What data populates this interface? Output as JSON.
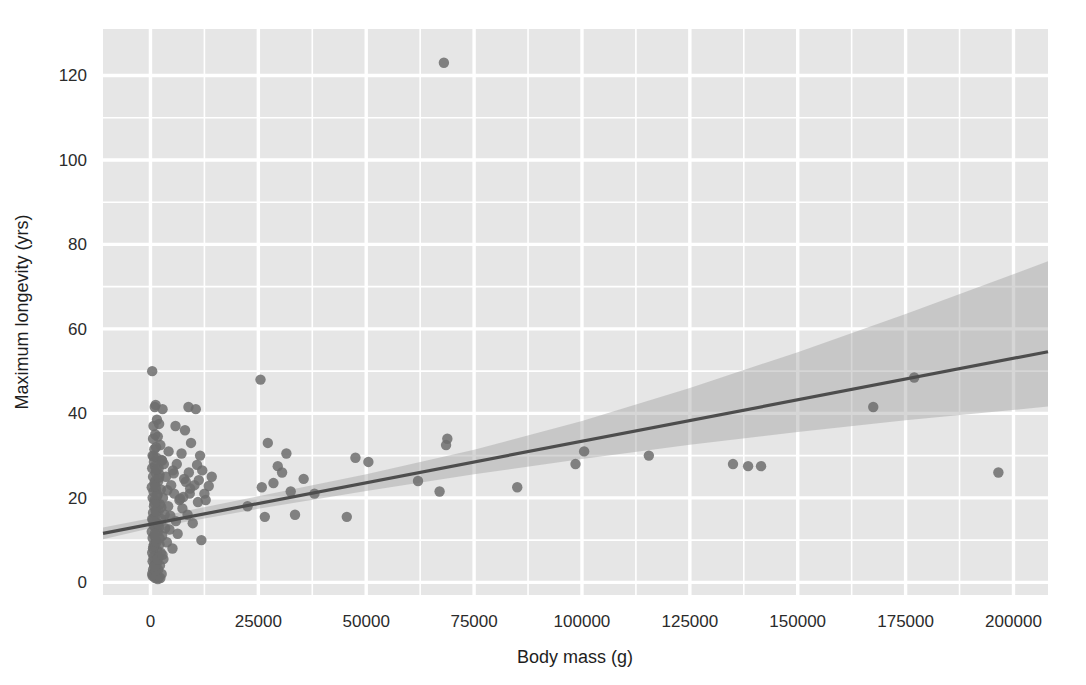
{
  "chart_data": {
    "type": "scatter",
    "title": "",
    "xlabel": "Body mass (g)",
    "ylabel": "Maximum longevity (yrs)",
    "xlim": [
      -11000,
      208000
    ],
    "ylim": [
      -3,
      131
    ],
    "xticks": [
      0,
      25000,
      50000,
      75000,
      100000,
      125000,
      150000,
      175000,
      200000
    ],
    "xticklabels": [
      "0",
      "25000",
      "50000",
      "75000",
      "100000",
      "125000",
      "150000",
      "175000",
      "200000"
    ],
    "yticks": [
      0,
      20,
      40,
      60,
      80,
      100,
      120
    ],
    "yticklabels": [
      "0",
      "20",
      "40",
      "60",
      "80",
      "100",
      "120"
    ],
    "grid": true,
    "grid_color": "#ffffff",
    "plot_background": "#e6e6e6",
    "figure_background": "#ffffff",
    "legend": null,
    "point_color": "#6d6d6d",
    "point_radius": 5.2,
    "point_opacity": 0.85,
    "regression": {
      "label": "linear fit",
      "line_color": "#4d4d4d",
      "line_width": 3.2,
      "intercept": 13.8,
      "slope_per_unit": 0.000196,
      "x_start": -11000,
      "x_end": 208000,
      "y_start": 11.6,
      "y_end": 54.6
    },
    "confidence_band": {
      "label": "95% CI",
      "fill_color": "#9e9e9e",
      "fill_opacity": 0.42,
      "x": [
        -11000,
        0,
        25000,
        50000,
        75000,
        100000,
        125000,
        150000,
        175000,
        208000
      ],
      "upper": [
        13.0,
        15.2,
        20.4,
        25.6,
        31.4,
        38.2,
        46.0,
        54.5,
        63.5,
        76.0
      ],
      "lower": [
        10.2,
        12.8,
        17.4,
        21.6,
        25.6,
        29.2,
        32.6,
        35.6,
        38.4,
        41.6
      ]
    },
    "points": [
      {
        "x": 400,
        "y": 50.0
      },
      {
        "x": 1200,
        "y": 42.0
      },
      {
        "x": 1000,
        "y": 41.5
      },
      {
        "x": 2800,
        "y": 41.0
      },
      {
        "x": 8800,
        "y": 41.5
      },
      {
        "x": 10500,
        "y": 41.0
      },
      {
        "x": 1500,
        "y": 38.5
      },
      {
        "x": 2000,
        "y": 37.5
      },
      {
        "x": 700,
        "y": 37.0
      },
      {
        "x": 5800,
        "y": 37.0
      },
      {
        "x": 8000,
        "y": 36.0
      },
      {
        "x": 1100,
        "y": 35.0
      },
      {
        "x": 1700,
        "y": 34.5
      },
      {
        "x": 600,
        "y": 34.0
      },
      {
        "x": 9400,
        "y": 33.0
      },
      {
        "x": 2300,
        "y": 32.5
      },
      {
        "x": 1300,
        "y": 32.0
      },
      {
        "x": 900,
        "y": 31.5
      },
      {
        "x": 4200,
        "y": 31.0
      },
      {
        "x": 7200,
        "y": 30.5
      },
      {
        "x": 11500,
        "y": 30.0
      },
      {
        "x": 500,
        "y": 30.0
      },
      {
        "x": 1400,
        "y": 29.5
      },
      {
        "x": 2600,
        "y": 29.0
      },
      {
        "x": 800,
        "y": 28.5
      },
      {
        "x": 3100,
        "y": 28.0
      },
      {
        "x": 6100,
        "y": 28.0
      },
      {
        "x": 1000,
        "y": 27.5
      },
      {
        "x": 1900,
        "y": 27.0
      },
      {
        "x": 400,
        "y": 27.0
      },
      {
        "x": 5200,
        "y": 26.5
      },
      {
        "x": 8900,
        "y": 26.0
      },
      {
        "x": 1200,
        "y": 26.0
      },
      {
        "x": 2100,
        "y": 25.5
      },
      {
        "x": 600,
        "y": 25.0
      },
      {
        "x": 3600,
        "y": 25.0
      },
      {
        "x": 7800,
        "y": 24.5
      },
      {
        "x": 1100,
        "y": 24.0
      },
      {
        "x": 1800,
        "y": 24.0
      },
      {
        "x": 900,
        "y": 23.5
      },
      {
        "x": 4800,
        "y": 23.0
      },
      {
        "x": 10200,
        "y": 23.0
      },
      {
        "x": 300,
        "y": 22.5
      },
      {
        "x": 2400,
        "y": 22.0
      },
      {
        "x": 1300,
        "y": 22.0
      },
      {
        "x": 700,
        "y": 21.5
      },
      {
        "x": 5500,
        "y": 21.0
      },
      {
        "x": 9100,
        "y": 21.0
      },
      {
        "x": 1600,
        "y": 20.5
      },
      {
        "x": 2900,
        "y": 20.0
      },
      {
        "x": 500,
        "y": 20.0
      },
      {
        "x": 1000,
        "y": 19.5
      },
      {
        "x": 6700,
        "y": 19.5
      },
      {
        "x": 11000,
        "y": 19.0
      },
      {
        "x": 1400,
        "y": 19.0
      },
      {
        "x": 2200,
        "y": 18.5
      },
      {
        "x": 800,
        "y": 18.0
      },
      {
        "x": 4100,
        "y": 18.0
      },
      {
        "x": 7400,
        "y": 17.5
      },
      {
        "x": 1200,
        "y": 17.0
      },
      {
        "x": 1900,
        "y": 17.0
      },
      {
        "x": 600,
        "y": 16.5
      },
      {
        "x": 3300,
        "y": 16.0
      },
      {
        "x": 8600,
        "y": 16.0
      },
      {
        "x": 1000,
        "y": 15.5
      },
      {
        "x": 2500,
        "y": 15.0
      },
      {
        "x": 400,
        "y": 15.0
      },
      {
        "x": 5900,
        "y": 14.5
      },
      {
        "x": 1500,
        "y": 14.0
      },
      {
        "x": 9800,
        "y": 14.0
      },
      {
        "x": 700,
        "y": 13.5
      },
      {
        "x": 2000,
        "y": 13.0
      },
      {
        "x": 1100,
        "y": 13.0
      },
      {
        "x": 4400,
        "y": 12.5
      },
      {
        "x": 300,
        "y": 12.0
      },
      {
        "x": 1700,
        "y": 12.0
      },
      {
        "x": 6300,
        "y": 11.5
      },
      {
        "x": 900,
        "y": 11.0
      },
      {
        "x": 2700,
        "y": 11.0
      },
      {
        "x": 11800,
        "y": 10.0
      },
      {
        "x": 500,
        "y": 10.5
      },
      {
        "x": 1300,
        "y": 10.0
      },
      {
        "x": 3800,
        "y": 9.5
      },
      {
        "x": 800,
        "y": 9.0
      },
      {
        "x": 2100,
        "y": 9.0
      },
      {
        "x": 1000,
        "y": 8.5
      },
      {
        "x": 5100,
        "y": 8.0
      },
      {
        "x": 600,
        "y": 8.0
      },
      {
        "x": 1600,
        "y": 7.5
      },
      {
        "x": 400,
        "y": 7.0
      },
      {
        "x": 2400,
        "y": 7.0
      },
      {
        "x": 1200,
        "y": 6.5
      },
      {
        "x": 700,
        "y": 6.0
      },
      {
        "x": 1900,
        "y": 6.0
      },
      {
        "x": 3000,
        "y": 5.5
      },
      {
        "x": 1000,
        "y": 5.0
      },
      {
        "x": 500,
        "y": 5.0
      },
      {
        "x": 1500,
        "y": 4.5
      },
      {
        "x": 900,
        "y": 4.0
      },
      {
        "x": 2200,
        "y": 4.0
      },
      {
        "x": 1300,
        "y": 3.5
      },
      {
        "x": 600,
        "y": 3.0
      },
      {
        "x": 1800,
        "y": 3.0
      },
      {
        "x": 1000,
        "y": 2.5
      },
      {
        "x": 400,
        "y": 2.0
      },
      {
        "x": 2600,
        "y": 2.0
      },
      {
        "x": 1400,
        "y": 1.8
      },
      {
        "x": 800,
        "y": 1.5
      },
      {
        "x": 2000,
        "y": 1.2
      },
      {
        "x": 1100,
        "y": 1.0
      },
      {
        "x": 1700,
        "y": 0.8
      },
      {
        "x": 500,
        "y": 1.5
      },
      {
        "x": 2300,
        "y": 1.0
      },
      {
        "x": 1200,
        "y": 2.8
      },
      {
        "x": 900,
        "y": 3.8
      },
      {
        "x": 1600,
        "y": 5.5
      },
      {
        "x": 2800,
        "y": 6.5
      },
      {
        "x": 700,
        "y": 8.5
      },
      {
        "x": 1400,
        "y": 9.5
      },
      {
        "x": 2100,
        "y": 10.5
      },
      {
        "x": 1000,
        "y": 11.5
      },
      {
        "x": 3400,
        "y": 12.8
      },
      {
        "x": 1800,
        "y": 13.8
      },
      {
        "x": 600,
        "y": 14.8
      },
      {
        "x": 4600,
        "y": 15.8
      },
      {
        "x": 1300,
        "y": 16.8
      },
      {
        "x": 2500,
        "y": 17.8
      },
      {
        "x": 900,
        "y": 18.8
      },
      {
        "x": 6900,
        "y": 19.8
      },
      {
        "x": 1600,
        "y": 20.8
      },
      {
        "x": 3900,
        "y": 21.8
      },
      {
        "x": 1100,
        "y": 22.8
      },
      {
        "x": 8200,
        "y": 23.8
      },
      {
        "x": 2000,
        "y": 24.8
      },
      {
        "x": 5400,
        "y": 25.8
      },
      {
        "x": 1400,
        "y": 26.8
      },
      {
        "x": 10800,
        "y": 27.8
      },
      {
        "x": 2700,
        "y": 28.8
      },
      {
        "x": 700,
        "y": 29.8
      },
      {
        "x": 7600,
        "y": 20.2
      },
      {
        "x": 9200,
        "y": 22.2
      },
      {
        "x": 11200,
        "y": 24.2
      },
      {
        "x": 12500,
        "y": 21.0
      },
      {
        "x": 12000,
        "y": 26.5
      },
      {
        "x": 12800,
        "y": 19.5
      },
      {
        "x": 13500,
        "y": 22.8
      },
      {
        "x": 14200,
        "y": 25.0
      },
      {
        "x": 22500,
        "y": 18.0
      },
      {
        "x": 25500,
        "y": 48.0
      },
      {
        "x": 26500,
        "y": 15.5
      },
      {
        "x": 27200,
        "y": 33.0
      },
      {
        "x": 25800,
        "y": 22.5
      },
      {
        "x": 28500,
        "y": 23.5
      },
      {
        "x": 29500,
        "y": 27.5
      },
      {
        "x": 30500,
        "y": 26.0
      },
      {
        "x": 31500,
        "y": 30.5
      },
      {
        "x": 32500,
        "y": 21.5
      },
      {
        "x": 33500,
        "y": 16.0
      },
      {
        "x": 35500,
        "y": 24.5
      },
      {
        "x": 38000,
        "y": 21.0
      },
      {
        "x": 45500,
        "y": 15.5
      },
      {
        "x": 47500,
        "y": 29.5
      },
      {
        "x": 50500,
        "y": 28.5
      },
      {
        "x": 62000,
        "y": 24.0
      },
      {
        "x": 67000,
        "y": 21.5
      },
      {
        "x": 68000,
        "y": 123.0
      },
      {
        "x": 68500,
        "y": 32.5
      },
      {
        "x": 68800,
        "y": 34.0
      },
      {
        "x": 85000,
        "y": 22.5
      },
      {
        "x": 98500,
        "y": 28.0
      },
      {
        "x": 100500,
        "y": 31.0
      },
      {
        "x": 115500,
        "y": 30.0
      },
      {
        "x": 135000,
        "y": 28.0
      },
      {
        "x": 138500,
        "y": 27.5
      },
      {
        "x": 141500,
        "y": 27.5
      },
      {
        "x": 167500,
        "y": 41.5
      },
      {
        "x": 177000,
        "y": 48.5
      },
      {
        "x": 196500,
        "y": 26.0
      }
    ]
  }
}
